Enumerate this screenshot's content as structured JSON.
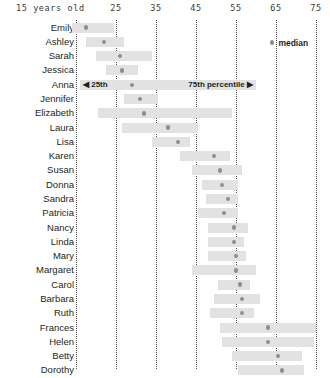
{
  "chart_data": {
    "type": "bar",
    "subtype": "range-bar-with-median",
    "title": "",
    "xlabel": "15 years old",
    "ylabel": "",
    "xlim": [
      13,
      79
    ],
    "grid": true,
    "gridlines": [
      15,
      25,
      35,
      45,
      55,
      65,
      75
    ],
    "tick_labels": [
      "15 years old",
      "25",
      "35",
      "45",
      "55",
      "65",
      "75"
    ],
    "tick_values": [
      15,
      25,
      35,
      45,
      55,
      65,
      75
    ],
    "legend": {
      "position": "top-right",
      "entries": [
        {
          "marker": "dot",
          "label": "median",
          "color": "#8e8e8e"
        }
      ]
    },
    "annotations": [
      {
        "row": "Anna",
        "text": "◀ 25th",
        "align": "left"
      },
      {
        "row": "Anna",
        "text": "75th percentile ▶",
        "align": "right"
      }
    ],
    "bar_color": "#e2e2e2",
    "median_color": "#8e8e8e",
    "categories": [
      "Emily",
      "Ashley",
      "Sarah",
      "Jessica",
      "Anna",
      "Jennifer",
      "Elizabeth",
      "Laura",
      "Lisa",
      "Karen",
      "Susan",
      "Donna",
      "Sandra",
      "Patricia",
      "Nancy",
      "Linda",
      "Mary",
      "Margaret",
      "Carol",
      "Barbara",
      "Ruth",
      "Frances",
      "Helen",
      "Betty",
      "Dorothy"
    ],
    "rows": [
      {
        "name": "Emily",
        "p25": 14.0,
        "median": 17.5,
        "p75": 24.5
      },
      {
        "name": "Ashley",
        "p25": 17.5,
        "median": 22.0,
        "p75": 27.0
      },
      {
        "name": "Sarah",
        "p25": 20.0,
        "median": 26.0,
        "p75": 34.0
      },
      {
        "name": "Jessica",
        "p25": 22.5,
        "median": 26.5,
        "p75": 30.5
      },
      {
        "name": "Anna",
        "p25": 16.0,
        "median": 29.0,
        "p75": 60.0
      },
      {
        "name": "Jennifer",
        "p25": 27.0,
        "median": 31.0,
        "p75": 35.5
      },
      {
        "name": "Elizabeth",
        "p25": 20.5,
        "median": 32.0,
        "p75": 54.0
      },
      {
        "name": "Laura",
        "p25": 26.5,
        "median": 38.0,
        "p75": 45.5
      },
      {
        "name": "Lisa",
        "p25": 34.0,
        "median": 40.5,
        "p75": 43.5
      },
      {
        "name": "Karen",
        "p25": 41.0,
        "median": 49.5,
        "p75": 53.5
      },
      {
        "name": "Susan",
        "p25": 44.0,
        "median": 51.0,
        "p75": 56.5
      },
      {
        "name": "Donna",
        "p25": 46.5,
        "median": 51.5,
        "p75": 55.5
      },
      {
        "name": "Sandra",
        "p25": 47.5,
        "median": 53.0,
        "p75": 55.5
      },
      {
        "name": "Patricia",
        "p25": 45.5,
        "median": 52.0,
        "p75": 55.5
      },
      {
        "name": "Nancy",
        "p25": 48.0,
        "median": 54.5,
        "p75": 58.0
      },
      {
        "name": "Linda",
        "p25": 48.0,
        "median": 54.5,
        "p75": 57.0
      },
      {
        "name": "Mary",
        "p25": 48.0,
        "median": 55.0,
        "p75": 57.5
      },
      {
        "name": "Margaret",
        "p25": 44.0,
        "median": 55.0,
        "p75": 60.0
      },
      {
        "name": "Carol",
        "p25": 50.5,
        "median": 56.0,
        "p75": 58.5
      },
      {
        "name": "Barbara",
        "p25": 49.5,
        "median": 56.5,
        "p75": 61.0
      },
      {
        "name": "Ruth",
        "p25": 48.5,
        "median": 56.5,
        "p75": 59.5
      },
      {
        "name": "Frances",
        "p25": 51.0,
        "median": 63.0,
        "p75": 75.0
      },
      {
        "name": "Helen",
        "p25": 51.5,
        "median": 63.0,
        "p75": 74.5
      },
      {
        "name": "Betty",
        "p25": 54.0,
        "median": 65.5,
        "p75": 71.5
      },
      {
        "name": "Dorothy",
        "p25": 55.5,
        "median": 66.5,
        "p75": 72.0
      }
    ]
  }
}
